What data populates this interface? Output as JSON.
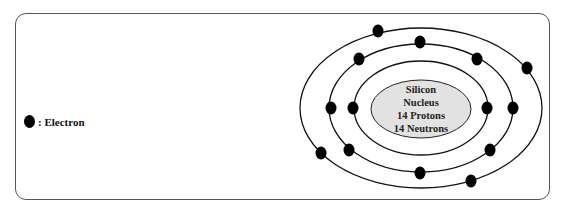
{
  "diagram": {
    "legend": {
      "symbol": "filled-black-circle",
      "label": ": Electron"
    },
    "nucleus": {
      "lines": [
        "Silicon",
        "Nucleus",
        "14 Protons",
        "14 Neutrons"
      ],
      "fill": "#e2e2e2",
      "center": [
        421,
        109
      ],
      "rx": 50,
      "ry": 29
    },
    "shells": [
      {
        "name": "inner",
        "center": [
          421,
          108
        ],
        "rx": 67,
        "ry": 47,
        "electron_count": 2,
        "electrons": [
          [
            353,
            108
          ],
          [
            487,
            108
          ]
        ]
      },
      {
        "name": "middle",
        "center": [
          421,
          108
        ],
        "rx": 92,
        "ry": 64,
        "electron_count": 8,
        "electrons": [
          [
            420,
            42
          ],
          [
            359,
            59
          ],
          [
            477,
            59
          ],
          [
            331,
            108
          ],
          [
            513,
            108
          ],
          [
            349,
            150
          ],
          [
            490,
            150
          ],
          [
            420,
            173
          ]
        ]
      },
      {
        "name": "outer",
        "center": [
          421,
          108
        ],
        "rx": 121,
        "ry": 80,
        "electron_count": 4,
        "electrons": [
          [
            378,
            31
          ],
          [
            527,
            68
          ],
          [
            321,
            153
          ],
          [
            471,
            181
          ]
        ]
      }
    ],
    "colors": {
      "line": "#111111",
      "electron": "#000000",
      "frame": "#555555",
      "nucleus_fill": "#e2e2e2"
    }
  }
}
